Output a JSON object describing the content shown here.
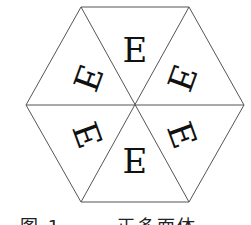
{
  "figure": {
    "shape": "regular hexagon divided into six equilateral triangles",
    "glyph": "E",
    "triangles": [
      {
        "position": "top",
        "orientation": "upright"
      },
      {
        "position": "upper-right",
        "orientation": "reflected"
      },
      {
        "position": "lower-right",
        "orientation": "rotated"
      },
      {
        "position": "bottom",
        "orientation": "vertically-flipped"
      },
      {
        "position": "lower-left",
        "orientation": "reflected"
      },
      {
        "position": "upper-left",
        "orientation": "rotated"
      }
    ],
    "line_color": "#555555",
    "glyph_color": "#111111"
  },
  "caption": "图 1  …… 正多面体 ……"
}
